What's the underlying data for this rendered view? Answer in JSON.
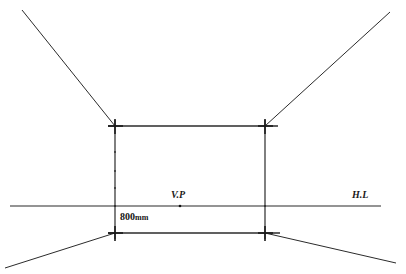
{
  "figure": {
    "kind": "one-point-perspective-construction",
    "background_color": "#ffffff",
    "line_color": "#2b2b2b",
    "width": 406,
    "height": 274
  },
  "labels": {
    "vanishing_point": "V.P",
    "horizon_line": "H.L",
    "dimension_value": "800",
    "dimension_unit": "mm",
    "dimension_full": "800mm"
  },
  "geometry": {
    "horizon_line": {
      "x1": 10,
      "y1": 206,
      "x2": 381,
      "y2": 206
    },
    "vanishing_point": {
      "x": 180,
      "y": 206
    },
    "rectangle": {
      "left": 115,
      "right": 265,
      "top": 126,
      "bottom": 233,
      "top_edge_overhang_left": 108,
      "top_edge_overhang_right": 278,
      "bottom_edge_overhang_left": 108,
      "bottom_edge_overhang_right": 280
    },
    "receding_lines": [
      {
        "name": "upper-left",
        "x1": 115,
        "y1": 126,
        "x2": 22,
        "y2": 10
      },
      {
        "name": "upper-right",
        "x1": 265,
        "y1": 126,
        "x2": 390,
        "y2": 12
      },
      {
        "name": "lower-left",
        "x1": 115,
        "y1": 233,
        "x2": 5,
        "y2": 268
      },
      {
        "name": "lower-right",
        "x1": 265,
        "y1": 233,
        "x2": 396,
        "y2": 263
      }
    ],
    "corner_cross_marks": [
      {
        "x": 115,
        "y": 126
      },
      {
        "x": 265,
        "y": 126
      },
      {
        "x": 115,
        "y": 233
      },
      {
        "x": 265,
        "y": 233
      }
    ],
    "tick_dots_left_vertical": [
      {
        "x": 115,
        "y": 152
      },
      {
        "x": 115,
        "y": 171
      },
      {
        "x": 115,
        "y": 188
      },
      {
        "x": 115,
        "y": 206
      }
    ],
    "tick_dots_right_vertical": [
      {
        "x": 265,
        "y": 206
      }
    ]
  }
}
